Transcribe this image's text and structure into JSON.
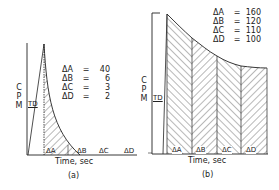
{
  "panel_a": {
    "y_label": [
      "C",
      "P",
      "M"
    ],
    "td_label": "TD",
    "x_label": "Time, sec",
    "caption": "(a)",
    "values": [
      {
        "key": "ΔA",
        "eq": "=",
        "val": "40"
      },
      {
        "key": "ΔB",
        "eq": "=",
        "val": "6"
      },
      {
        "key": "ΔC",
        "eq": "=",
        "val": "3"
      },
      {
        "key": "ΔD",
        "eq": "=",
        "val": "2"
      }
    ],
    "segments": [
      "ΔA",
      "ΔB",
      "ΔC",
      "ΔD"
    ]
  },
  "panel_b": {
    "y_label": [
      "C",
      "P",
      "M"
    ],
    "td_label": "TD",
    "x_label": "Time, sec",
    "caption": "(b)",
    "values": [
      {
        "key": "ΔA",
        "eq": "=",
        "val": "160"
      },
      {
        "key": "ΔB",
        "eq": "=",
        "val": "120"
      },
      {
        "key": "ΔC",
        "eq": "=",
        "val": "110"
      },
      {
        "key": "ΔD",
        "eq": "=",
        "val": "100"
      }
    ],
    "segments": [
      "ΔA",
      "ΔB",
      "ΔC",
      "ΔD"
    ]
  },
  "colors": {
    "ink": "#222222",
    "background": "#ffffff"
  }
}
